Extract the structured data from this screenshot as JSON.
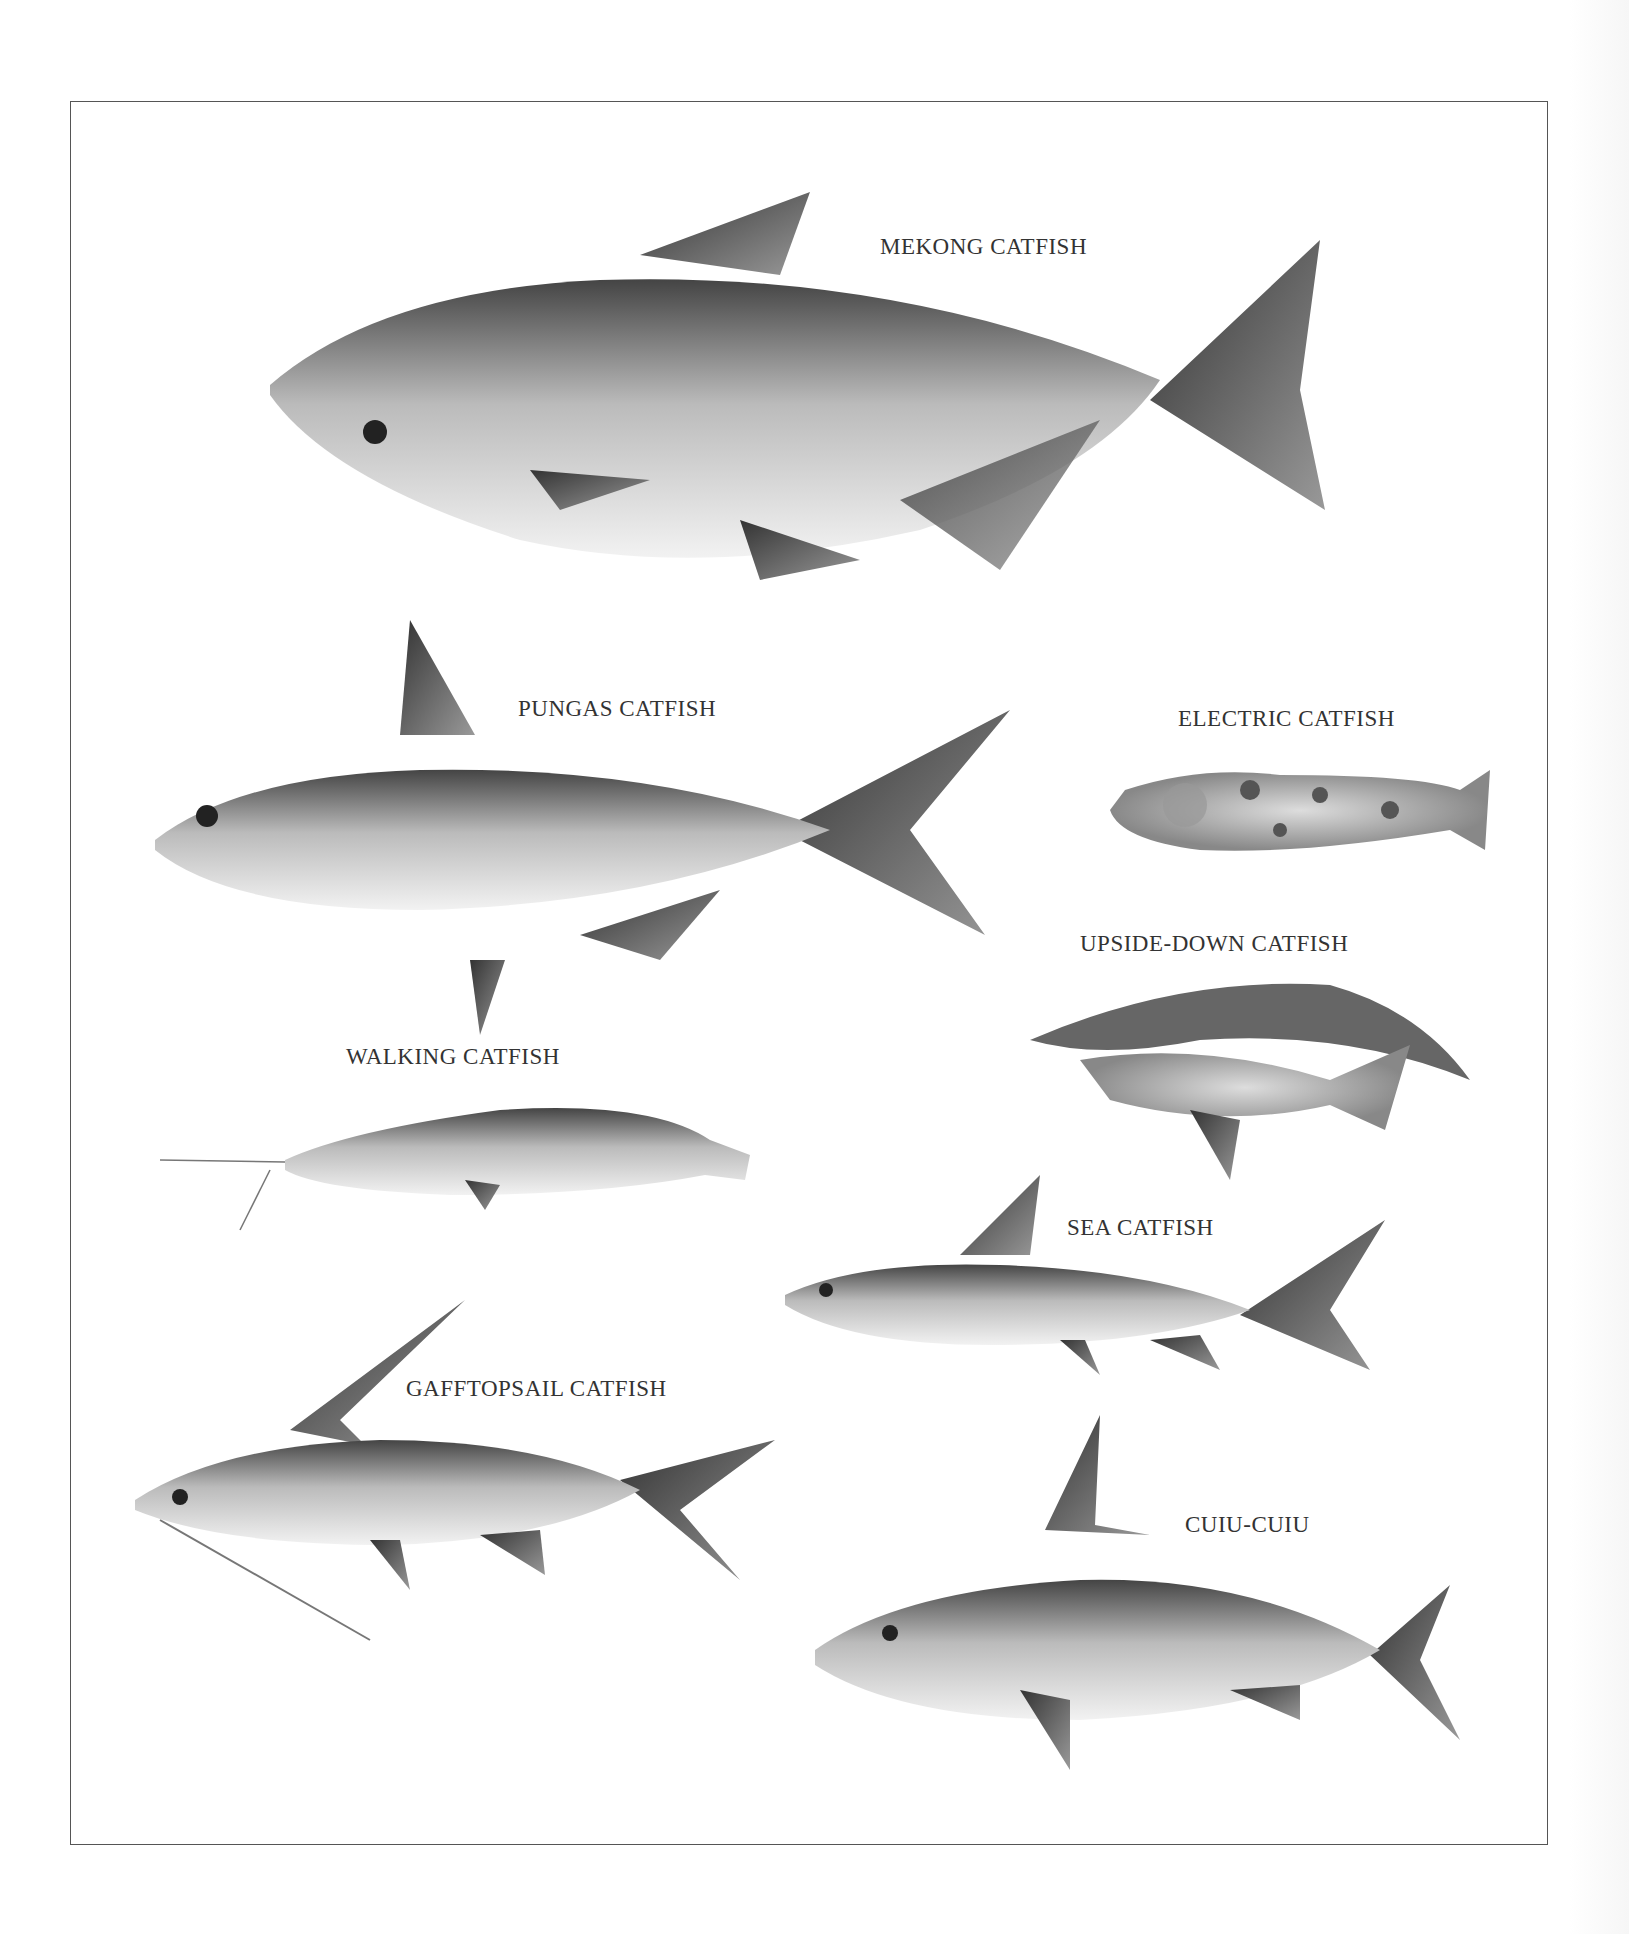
{
  "plate": {
    "labels": [
      {
        "id": "mekong",
        "text": "MEKONG CATFISH"
      },
      {
        "id": "pungas",
        "text": "PUNGAS CATFISH"
      },
      {
        "id": "electric",
        "text": "ELECTRIC CATFISH"
      },
      {
        "id": "upside_down",
        "text": "UPSIDE-DOWN CATFISH"
      },
      {
        "id": "walking",
        "text": "WALKING CATFISH"
      },
      {
        "id": "sea",
        "text": "SEA CATFISH"
      },
      {
        "id": "gafftopsail",
        "text": "GAFFTOPSAIL CATFISH"
      },
      {
        "id": "cuiu",
        "text": "CUIU-CUIU"
      }
    ]
  }
}
